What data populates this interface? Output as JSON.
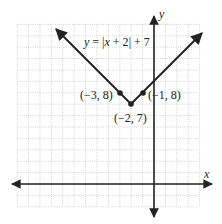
{
  "chart_data": {
    "type": "line",
    "title": "",
    "equation_label": "y = |x + 2| + 7",
    "xlabel": "x",
    "ylabel": "y",
    "xlim": [
      -12,
      4
    ],
    "ylim": [
      -2,
      14
    ],
    "grid": true,
    "grid_step": 1,
    "series": [
      {
        "name": "y = |x + 2| + 7",
        "function": "abs(x+2)+7",
        "x": [
          -10,
          -3,
          -2,
          -1,
          4
        ],
        "y": [
          15,
          8,
          7,
          8,
          13
        ]
      }
    ],
    "points": [
      {
        "x": -3,
        "y": 8,
        "label": "(−3, 8)"
      },
      {
        "x": -2,
        "y": 7,
        "label": "(−2, 7)"
      },
      {
        "x": -1,
        "y": 8,
        "label": "(−1, 8)"
      }
    ]
  },
  "labels": {
    "x_axis": "x",
    "y_axis": "y",
    "eq_y": "y",
    "eq_x": "x",
    "eq_rest_1": " = ",
    "eq_rest_2": " + 2",
    "eq_rest_3": " + 7",
    "pt1": "(−3, 8)",
    "pt2": "(−2, 7)",
    "pt3": "(−1, 8)"
  }
}
